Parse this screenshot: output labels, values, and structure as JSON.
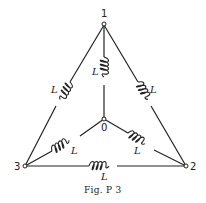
{
  "figure": {
    "caption": "Fig. P 3",
    "nodes": [
      {
        "id": "1",
        "label": "1"
      },
      {
        "id": "2",
        "label": "2"
      },
      {
        "id": "3",
        "label": "3"
      },
      {
        "id": "0",
        "label": "0"
      }
    ],
    "inductors": [
      {
        "from": "1",
        "to": "3",
        "label": "L"
      },
      {
        "from": "1",
        "to": "2",
        "label": "L"
      },
      {
        "from": "3",
        "to": "2",
        "label": "L"
      },
      {
        "from": "1",
        "to": "0",
        "label": "L"
      },
      {
        "from": "3",
        "to": "0",
        "label": "L"
      },
      {
        "from": "2",
        "to": "0",
        "label": "L"
      }
    ]
  }
}
